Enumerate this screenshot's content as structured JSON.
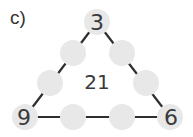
{
  "label": "c)",
  "puzzle": {
    "type": "triangle-sum",
    "center_sum": "21",
    "corners": {
      "top": "3",
      "bottom_left": "9",
      "bottom_right": "6"
    },
    "blank_circles": 6,
    "circle_color": "#e8e8e8",
    "line_color": "#2f2f2f"
  }
}
